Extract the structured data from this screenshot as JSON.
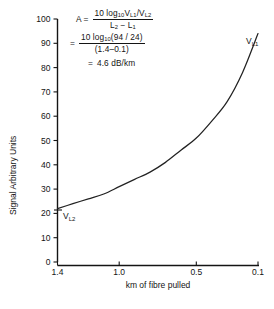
{
  "chart_data": {
    "type": "line",
    "title": "",
    "xlabel": "km of fibre pulled",
    "ylabel": "Signal Arbitrary Units",
    "xlim": [
      1.4,
      0.1
    ],
    "ylim": [
      0,
      100
    ],
    "x_ticks": [
      "1.4",
      "1.0",
      "0.5",
      "0.1"
    ],
    "x_tick_values": [
      1.4,
      1.0,
      0.5,
      0.1
    ],
    "y_ticks": [
      "0",
      "10",
      "20",
      "30",
      "40",
      "50",
      "60",
      "70",
      "80",
      "90",
      "100"
    ],
    "y_tick_values": [
      0,
      10,
      20,
      30,
      40,
      50,
      60,
      70,
      80,
      90,
      100
    ],
    "grid": false,
    "legend": "none",
    "x_axis_reversed": true,
    "series": [
      {
        "name": "signal",
        "x": [
          1.4,
          1.3,
          1.2,
          1.1,
          1.0,
          0.9,
          0.8,
          0.7,
          0.6,
          0.5,
          0.4,
          0.3,
          0.2,
          0.1
        ],
        "values": [
          22,
          24,
          26,
          28,
          31,
          34,
          37,
          41,
          46,
          51,
          58,
          66,
          78,
          94
        ]
      }
    ],
    "annotations": [
      {
        "text": "V",
        "sub": "L1",
        "x": 0.06,
        "y": 91
      },
      {
        "text": "V",
        "sub": "L2",
        "x": 1.33,
        "y": 19
      }
    ]
  },
  "formula": {
    "line1": {
      "lhs": "A  =",
      "numerator_prefix": "10 log",
      "numerator_log_sub": "10",
      "numerator_v1": "V",
      "numerator_v1_sub": "L1",
      "numerator_slash": "/",
      "numerator_v2": "V",
      "numerator_v2_sub": "L2",
      "denominator_l2": "L",
      "denominator_l2_sub": "2",
      "denominator_minus": "−",
      "denominator_l1": "L",
      "denominator_l1_sub": "1"
    },
    "line2": {
      "lhs": "=",
      "numerator_prefix": "10 log",
      "numerator_log_sub": "10",
      "numerator_args": "(94 / 24)",
      "denominator": "(1.4–0.1)"
    },
    "line3": {
      "lhs": "=",
      "value": "4.6 dB/km"
    }
  },
  "curve_labels": {
    "upper": "V",
    "upper_sub": "L1",
    "lower": "V",
    "lower_sub": "L2"
  },
  "axes": {
    "y_title": "Signal Arbitrary Units",
    "x_title": "km of fibre pulled"
  },
  "colors": {
    "ink": "#141414",
    "background": "#ffffff",
    "curve": "#222222"
  }
}
